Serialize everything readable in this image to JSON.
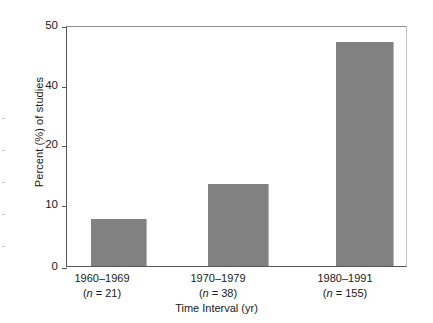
{
  "chart_data": {
    "type": "bar",
    "title": "",
    "xlabel": "Time Interval (yr)",
    "ylabel": "Percent (%) of studies",
    "categories": [
      "1960–1969",
      "1970–1979",
      "1980–1991"
    ],
    "category_sublabels": [
      "(n = 21)",
      "(n = 38)",
      "(n = 155)"
    ],
    "sample_sizes": [
      21,
      38,
      155
    ],
    "values": [
      9.7,
      17.0,
      46.5
    ],
    "ylim": [
      0,
      50
    ],
    "ytick_labels": [
      "50",
      "40",
      "20",
      "10",
      "0"
    ],
    "ytick_positions": [
      50,
      40,
      30,
      20,
      10
    ],
    "grid": false,
    "legend": false,
    "bar_color": "#828282",
    "axis_color": "#555555"
  },
  "axis": {
    "y_title": "Percent (%) of studies",
    "x_title": "Time Interval (yr)"
  },
  "categories": [
    {
      "range": "1960–1969",
      "n_prefix": "(",
      "n_italic": "n",
      "n_suffix": " = 21)"
    },
    {
      "range": "1970–1979",
      "n_prefix": "(",
      "n_italic": "n",
      "n_suffix": " = 38)"
    },
    {
      "range": "1980–1991",
      "n_prefix": "(",
      "n_italic": "n",
      "n_suffix": " = 155)"
    }
  ]
}
